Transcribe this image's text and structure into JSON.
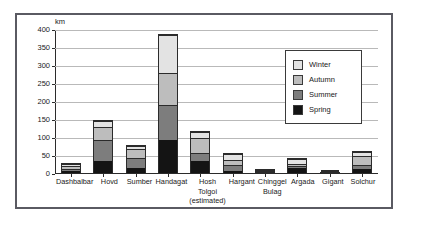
{
  "chart_data": {
    "type": "bar",
    "subtype": "stacked-bar",
    "title": "",
    "xlabel": "",
    "ylabel": "km",
    "unit_label": "km",
    "ylim": [
      0,
      400
    ],
    "yticks": [
      0,
      50,
      100,
      150,
      200,
      250,
      300,
      350,
      400
    ],
    "grid": true,
    "legend_position": "inside-top-right",
    "categories": [
      "Dashbalbar",
      "Hovd",
      "Sumber",
      "Handagat",
      "Hosh Tolgoi (estimated)",
      "Hargant",
      "Chinggel Bulag",
      "Argada",
      "Gigant",
      "Solchur"
    ],
    "category_lines": [
      [
        "Dashbalbar"
      ],
      [
        "Hovd"
      ],
      [
        "Sumber"
      ],
      [
        "Handagat"
      ],
      [
        "Hosh",
        "Tolgoi",
        "(estimated)"
      ],
      [
        "Hargant"
      ],
      [
        "Chinggel",
        "Bulag"
      ],
      [
        "Argada"
      ],
      [
        "Gigant"
      ],
      [
        "Solchur"
      ]
    ],
    "series": [
      {
        "name": "Spring",
        "color": "#141414",
        "values": [
          8,
          38,
          18,
          96,
          38,
          9,
          2,
          22,
          2,
          13
        ]
      },
      {
        "name": "Summer",
        "color": "#7d7d7d",
        "values": [
          10,
          59,
          30,
          96,
          21,
          18,
          3,
          2,
          1,
          12
        ]
      },
      {
        "name": "Autumn",
        "color": "#bdbdbd",
        "values": [
          7,
          38,
          25,
          90,
          46,
          15,
          5,
          4,
          1,
          27
        ]
      },
      {
        "name": "Winter",
        "color": "#e3e3e3",
        "values": [
          5,
          16,
          7,
          108,
          15,
          15,
          5,
          17,
          2,
          13
        ]
      }
    ],
    "totals": [
      30,
      151,
      80,
      390,
      120,
      57,
      15,
      45,
      6,
      65
    ],
    "legend_entries": [
      {
        "label": "Winter",
        "color": "#e3e3e3"
      },
      {
        "label": "Autumn",
        "color": "#bdbdbd"
      },
      {
        "label": "Summer",
        "color": "#7d7d7d"
      },
      {
        "label": "Spring",
        "color": "#141414"
      }
    ]
  }
}
